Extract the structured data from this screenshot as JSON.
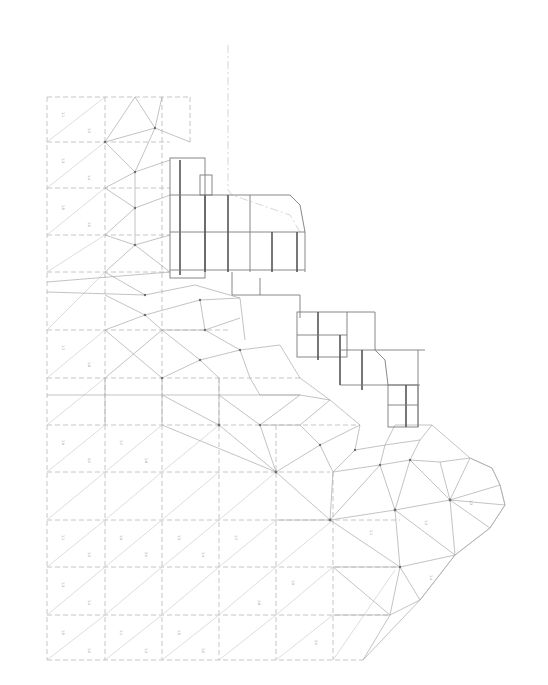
{
  "drawing": {
    "type": "finite-element triangulated mesh with stepped building outline",
    "background": "#ffffff",
    "line_color": "#b8b8b8",
    "building_color": "#6e6e6e",
    "grid": {
      "columns_x": [
        47,
        105,
        162,
        219,
        276,
        333,
        390
      ],
      "rows_y": [
        97,
        142,
        188,
        235,
        282,
        330,
        378,
        425,
        472,
        520,
        567,
        615,
        665
      ]
    },
    "element_labels": [
      "1.1",
      "1.2",
      "1.3",
      "1.4",
      "1.5",
      "1.6",
      "1.7",
      "1.8",
      "1.9",
      "2.0"
    ],
    "note": "Element labels are tiny rotated numeric tags; not legible at screenshot resolution"
  }
}
